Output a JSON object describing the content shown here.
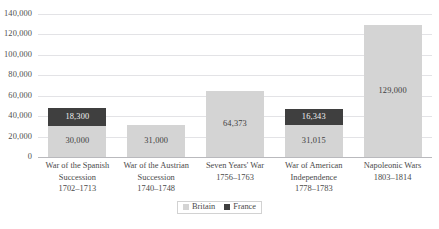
{
  "chart_data": {
    "type": "bar",
    "subtype": "stacked-bar",
    "title": "",
    "xlabel": "",
    "ylabel": "",
    "ylim": [
      0,
      140000
    ],
    "ytick_step": 20000,
    "yticks": [
      "0",
      "20,000",
      "40,000",
      "60,000",
      "80,000",
      "100,000",
      "120,000",
      "140,000"
    ],
    "ytick_values": [
      0,
      20000,
      40000,
      60000,
      80000,
      100000,
      120000,
      140000
    ],
    "grid": true,
    "legend_position": "bottom",
    "categories": [
      "War of the Spanish Succession 1702–1713",
      "War of the Austrian Succession 1740–1748",
      "Seven Years' War 1756–1763",
      "War of American Independence 1778–1783",
      "Napoleonic Wars 1803–1814"
    ],
    "category_lines": [
      [
        "War of the Spanish",
        "Succession",
        "1702–1713"
      ],
      [
        "War of the Austrian",
        "Succession",
        "1740–1748"
      ],
      [
        "Seven Years' War",
        "1756–1763"
      ],
      [
        "War of American",
        "Independence",
        "1778–1783"
      ],
      [
        "Napoleonic Wars",
        "1803–1814"
      ]
    ],
    "series": [
      {
        "name": "Britain",
        "color": "#d4d4d4",
        "values": [
          30000,
          31000,
          64373,
          31015,
          129000
        ],
        "labels": [
          "30,000",
          "31,000",
          "64,373",
          "31,015",
          "129,000"
        ]
      },
      {
        "name": "France",
        "color": "#3f3f3f",
        "values": [
          18300,
          0,
          0,
          16343,
          0
        ],
        "labels": [
          "18,300",
          "",
          "",
          "16,343",
          ""
        ]
      }
    ],
    "totals": [
      48300,
      31000,
      64373,
      47358,
      129000
    ]
  },
  "legend": {
    "items": [
      {
        "label": "Britain",
        "swatch": "britain"
      },
      {
        "label": "France",
        "swatch": "france"
      }
    ]
  }
}
